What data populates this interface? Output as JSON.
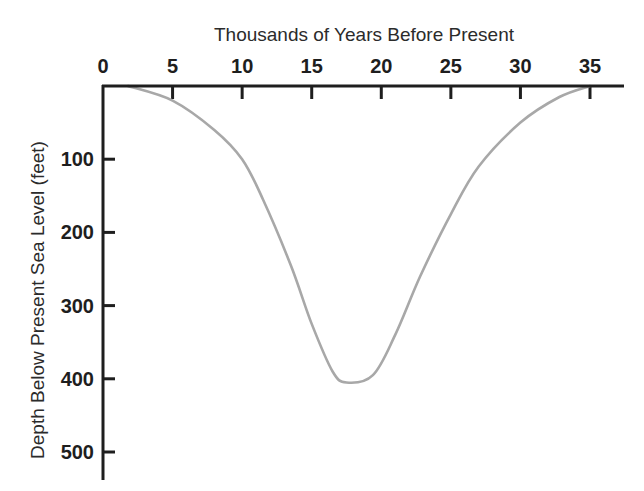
{
  "chart_data": {
    "type": "line",
    "title": "Thousands of Years Before Present",
    "xlabel": "Thousands of Years Before Present",
    "ylabel": "Depth Below Present Sea Level (feet)",
    "x_axis_position": "top",
    "y_axis_inverted": true,
    "xlim": [
      0,
      37
    ],
    "ylim": [
      0,
      540
    ],
    "x_ticks": [
      0,
      5,
      10,
      15,
      20,
      25,
      30,
      35
    ],
    "x_tick_labels": [
      "0",
      "5",
      "10",
      "15",
      "20",
      "25",
      "30",
      "35"
    ],
    "y_ticks": [
      100,
      200,
      300,
      400,
      500
    ],
    "y_tick_labels": [
      "100",
      "200",
      "300",
      "400",
      "500"
    ],
    "grid": false,
    "legend": null,
    "series": [
      {
        "name": "Sea level depth",
        "color": "#a8a8a8",
        "x": [
          1.8,
          5,
          8,
          10,
          11.5,
          13.5,
          15,
          16.5,
          17.5,
          19.4,
          21,
          22.8,
          25,
          27,
          30,
          32.8,
          35
        ],
        "y": [
          0,
          20,
          60,
          100,
          155,
          245,
          325,
          390,
          405,
          395,
          340,
          260,
          175,
          110,
          50,
          15,
          0
        ]
      }
    ],
    "annotations": []
  }
}
